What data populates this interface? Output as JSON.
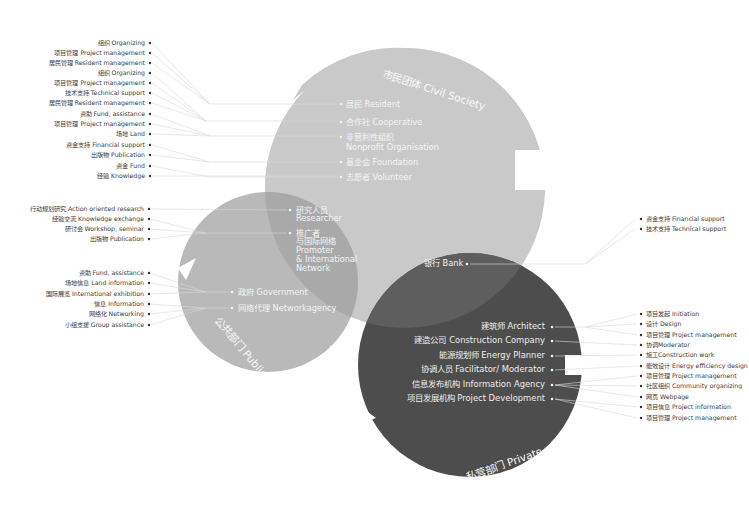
{
  "diagram": {
    "colors": {
      "civil_society": "#c9c9c9",
      "public": "#b9b9b9",
      "public_overlap": "#a9a9a9",
      "private": "#4d4d4d",
      "private_overlap": "#5e5e5e",
      "text_on_light": "#f4f4f4",
      "text_on_dark": "#eeeeee",
      "label_text": "#3a3a3a"
    },
    "circles": {
      "civil_society": {
        "title": "市民团体 Civil Society",
        "members": [
          {
            "zh": "居民",
            "en": "Resident"
          },
          {
            "zh": "合作社",
            "en": "Cooperative"
          },
          {
            "zh": "非营利性组织",
            "en": "Nonprofit Organisation"
          },
          {
            "zh": "基金会",
            "en": "Foundation"
          },
          {
            "zh": "志愿者",
            "en": "Volunteer"
          }
        ]
      },
      "public": {
        "title": "公共部门 Public",
        "overlap_members": [
          {
            "zh": "研究人员",
            "en": "Researcher"
          },
          {
            "zh": "推广者",
            "zh2": "与国际网络",
            "en": "Promoter",
            "en2": "& International",
            "en3": "Network"
          }
        ],
        "members": [
          {
            "zh": "政府",
            "en": "Government"
          },
          {
            "zh": "网络代理",
            "en": "Networkagency"
          }
        ]
      },
      "private": {
        "title": "私营部门 Private",
        "overlap_members": [
          {
            "zh": "银行",
            "en": "Bank"
          }
        ],
        "members": [
          {
            "zh": "建筑师",
            "en": "Architect"
          },
          {
            "zh": "建造公司",
            "en": "Construction Company"
          },
          {
            "zh": "能源规划师",
            "en": "Energy Planner"
          },
          {
            "zh": "协调人员",
            "en": "Facilitator/ Moderator"
          },
          {
            "zh": "信息发布机构",
            "en": "Information Agency"
          },
          {
            "zh": "项目发展机构",
            "en": "Project Development"
          }
        ]
      }
    },
    "roles": {
      "civil_society": [
        "组织 Organizing",
        "项目管理 Project management",
        "居民管理 Resident management",
        "组织 Organizing",
        "项目管理 Project management",
        "技术支持 Technical support",
        "居民管理 Resident management",
        "资助 Fund, assistance",
        "项目管理 Project management",
        "场地 Land",
        "资金支持 Financial support",
        "出版物 Publication",
        "资金 Fund",
        "经验 Knowledge"
      ],
      "public_overlap": [
        "行动规划研究 Action oriented research",
        "经验交流 Knowledge exchange",
        "研讨会 Workshop, seminar",
        "出版物 Publication"
      ],
      "public": [
        "资助 Fund, assistance",
        "场地信息 Land information",
        "国际展览 International exhibition",
        "信息 Information",
        "网络化 Networking",
        "小组支援 Group assistance"
      ],
      "bank": [
        "资金支持 Financial support",
        "技术支持 Technical support"
      ],
      "private": [
        "项目发起 Initiation",
        "设计 Design",
        "项目管理 Project management",
        "协调Moderator",
        "施工Construction work",
        "能效设计 Energy efficiency design",
        "项目管理 Project management",
        "社区组织 Community organizing",
        "网页 Webpage",
        "项目信息 Project information",
        "项目管理 Project management"
      ]
    }
  }
}
